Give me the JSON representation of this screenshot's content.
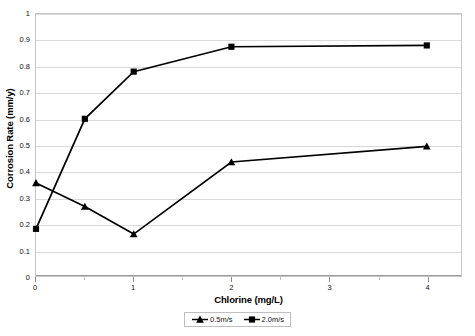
{
  "chart_data": {
    "type": "line",
    "title": "",
    "xlabel": "Chlorine (mg/L)",
    "ylabel": "Corrosion Rate (mm/y)",
    "x": [
      0,
      0.5,
      1,
      2,
      4
    ],
    "xlim": [
      0,
      4.35
    ],
    "ylim": [
      0,
      1
    ],
    "grid": true,
    "legend_position": "bottom-center",
    "x_tick_labels": [
      "0",
      "1",
      "2",
      "3",
      "4"
    ],
    "x_tick_values": [
      0,
      1,
      2,
      3,
      4
    ],
    "x_minor_tick_values": [
      0.5,
      1.5,
      2.5,
      3.5
    ],
    "y_tick_labels": [
      "0",
      "0.1",
      "0.2",
      "0.3",
      "0.4",
      "0.5",
      "0.6",
      "0.7",
      "0.8",
      "0.9",
      "1"
    ],
    "y_tick_values": [
      0,
      0.1,
      0.2,
      0.3,
      0.4,
      0.5,
      0.6,
      0.7,
      0.8,
      0.9,
      1
    ],
    "series": [
      {
        "name": "0.5m/s",
        "marker": "triangle",
        "color": "#000000",
        "values": [
          0.355,
          0.265,
          0.16,
          0.435,
          0.495
        ]
      },
      {
        "name": "2.0m/s",
        "marker": "square",
        "color": "#000000",
        "values": [
          0.18,
          0.6,
          0.78,
          0.875,
          0.88
        ]
      }
    ]
  },
  "legend": {
    "entries": [
      {
        "label": "0.5m/s"
      },
      {
        "label": "2.0m/s"
      }
    ]
  }
}
